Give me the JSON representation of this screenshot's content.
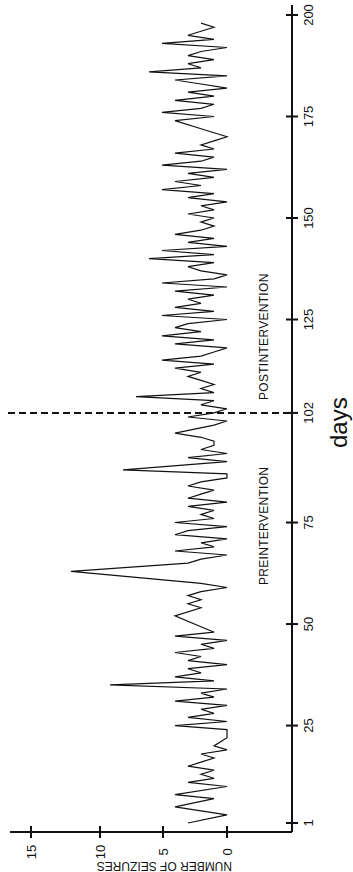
{
  "chart_data": {
    "type": "line",
    "orientation": "rotated-90-clockwise",
    "title": "",
    "xlabel": "days",
    "ylabel": "NUMBER OF SEIZURES",
    "x_ticks": [
      1,
      25,
      50,
      75,
      102,
      125,
      150,
      175,
      200
    ],
    "y_ticks": [
      0,
      5,
      10,
      15
    ],
    "xlim": [
      1,
      200
    ],
    "ylim": [
      0,
      15
    ],
    "grid": false,
    "legend": null,
    "intervention_day": 102,
    "annotations": [
      {
        "text": "PREINTERVENTION",
        "position": "days 65-95"
      },
      {
        "text": "POSTINTERVENTION",
        "position": "days 105-140"
      }
    ],
    "series": [
      {
        "name": "seizures",
        "x": [
          1,
          3,
          5,
          7,
          8,
          10,
          11,
          12,
          13,
          14,
          15,
          16,
          17,
          18,
          19,
          20,
          22,
          24,
          25,
          26,
          27,
          28,
          29,
          30,
          31,
          32,
          33,
          34,
          35,
          36,
          37,
          38,
          39,
          40,
          41,
          42,
          43,
          44,
          45,
          46,
          47,
          48,
          52,
          54,
          55,
          56,
          57,
          58,
          59,
          60,
          63,
          65,
          66,
          67,
          68,
          69,
          70,
          71,
          72,
          73,
          74,
          75,
          76,
          77,
          78,
          79,
          80,
          81,
          82,
          83,
          84,
          85,
          86,
          87,
          88,
          90,
          91,
          92,
          93,
          94,
          95,
          96,
          97,
          99,
          100,
          101,
          102,
          103,
          104,
          105,
          106,
          107,
          108,
          109,
          110,
          111,
          112,
          113,
          114,
          115,
          116,
          117,
          118,
          119,
          120,
          121,
          122,
          123,
          124,
          125,
          126,
          127,
          128,
          129,
          130,
          131,
          132,
          133,
          134,
          135,
          136,
          137,
          138,
          139,
          140,
          141,
          142,
          143,
          144,
          145,
          146,
          147,
          148,
          149,
          150,
          151,
          152,
          153,
          154,
          155,
          156,
          157,
          158,
          159,
          160,
          161,
          162,
          163,
          164,
          165,
          166,
          167,
          168,
          169,
          170,
          171,
          172,
          174,
          175,
          176,
          177,
          178,
          179,
          180,
          181,
          182,
          183,
          184,
          185,
          186,
          187,
          188,
          189,
          190,
          191,
          192,
          193,
          194,
          195,
          196,
          197,
          198
        ],
        "y": [
          3,
          0,
          4,
          1,
          4,
          0,
          3,
          1,
          2,
          1,
          3,
          2,
          1,
          2,
          0,
          1,
          0,
          0,
          4,
          0,
          3,
          1,
          2,
          0,
          4,
          1,
          2,
          0,
          9,
          1,
          4,
          2,
          3,
          0,
          3,
          2,
          4,
          1,
          2,
          0,
          4,
          1,
          4,
          2,
          3,
          2,
          3,
          2,
          0,
          2,
          12,
          3,
          2,
          0,
          4,
          1,
          2,
          0,
          4,
          3,
          0,
          4,
          1,
          2,
          1,
          3,
          0,
          3,
          2,
          1,
          3,
          2,
          0,
          0,
          8,
          0,
          3,
          0,
          2,
          1,
          1,
          2,
          4,
          1,
          0,
          3,
          1,
          0,
          2,
          1,
          7,
          1,
          2,
          1,
          2,
          3,
          2,
          4,
          1,
          5,
          2,
          1,
          0,
          4,
          1,
          5,
          2,
          4,
          3,
          0,
          5,
          1,
          4,
          2,
          3,
          1,
          4,
          0,
          5,
          1,
          0,
          2,
          3,
          1,
          6,
          1,
          5,
          0,
          3,
          1,
          4,
          2,
          1,
          2,
          1,
          3,
          1,
          2,
          0,
          3,
          1,
          5,
          2,
          4,
          1,
          3,
          0,
          5,
          2,
          1,
          4,
          1,
          2,
          1,
          0,
          1,
          2,
          4,
          1,
          5,
          2,
          1,
          4,
          1,
          3,
          0,
          2,
          4,
          0,
          6,
          2,
          3,
          1,
          3,
          2,
          0,
          5,
          1,
          3,
          2,
          1,
          2
        ],
        "color": "#111111"
      }
    ]
  }
}
